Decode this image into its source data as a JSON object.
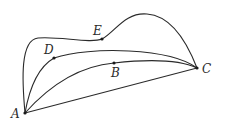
{
  "diagram": {
    "type": "geometry-paths",
    "points": {
      "A": {
        "label": "A",
        "x": 25,
        "y": 113
      },
      "B": {
        "label": "B",
        "x": 114,
        "y": 63
      },
      "C": {
        "label": "C",
        "x": 197,
        "y": 68
      },
      "D": {
        "label": "D",
        "x": 54,
        "y": 58
      },
      "E": {
        "label": "E",
        "x": 102,
        "y": 39
      }
    },
    "paths": [
      {
        "name": "segment-AC",
        "through": [
          "A",
          "C"
        ],
        "kind": "straight"
      },
      {
        "name": "curve-ABC",
        "through": [
          "A",
          "B",
          "C"
        ],
        "kind": "curve"
      },
      {
        "name": "curve-ADC",
        "through": [
          "A",
          "D",
          "C"
        ],
        "kind": "curve"
      },
      {
        "name": "curve-AEC",
        "through": [
          "A",
          "E",
          "C"
        ],
        "kind": "curve"
      }
    ],
    "colors": {
      "stroke": "#2a2a2a",
      "background": "#ffffff"
    }
  }
}
